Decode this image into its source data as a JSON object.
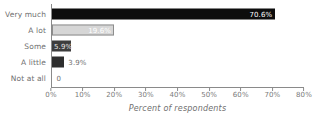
{
  "chart_data": {
    "type": "bar",
    "orientation": "horizontal",
    "title": "",
    "xlabel": "Percent of respondents",
    "ylabel": "",
    "xlim": [
      0,
      80
    ],
    "grid": false,
    "legend": false,
    "categories": [
      "Very much",
      "A lot",
      "Some",
      "A little",
      "Not at all"
    ],
    "values": [
      70.6,
      19.6,
      5.9,
      3.9,
      0
    ],
    "data_labels": [
      "70.6%",
      "19.6%",
      "5.9%",
      "3.9%",
      "0"
    ],
    "xticks": [
      0,
      10,
      20,
      30,
      40,
      50,
      60,
      70,
      80
    ],
    "xtick_labels": [
      "0%",
      "10%",
      "20%",
      "30%",
      "40%",
      "50%",
      "60%",
      "70%",
      "80%"
    ],
    "bar_colors": [
      "#0d0d0d",
      "#d6d6d6",
      "#3d3d3d",
      "#2e2e2e",
      "transparent"
    ],
    "bars": [
      {
        "category": "Very much",
        "value": 70.6,
        "label": "70.6%",
        "style": "s-black",
        "label_position": "inside-right"
      },
      {
        "category": "A lot",
        "value": 19.6,
        "label": "19.6%",
        "style": "s-light",
        "label_position": "inside-right"
      },
      {
        "category": "Some",
        "value": 5.9,
        "label": "5.9%",
        "style": "s-dark",
        "label_position": "inside-left"
      },
      {
        "category": "A little",
        "value": 3.9,
        "label": "3.9%",
        "style": "s-darker",
        "label_position": "outside"
      },
      {
        "category": "Not at all",
        "value": 0,
        "label": "0",
        "style": "s-none",
        "label_position": "outside"
      }
    ]
  },
  "colors": {
    "axis": "#8a8a8a",
    "text": "#6f6f6f",
    "background": "#ffffff"
  }
}
